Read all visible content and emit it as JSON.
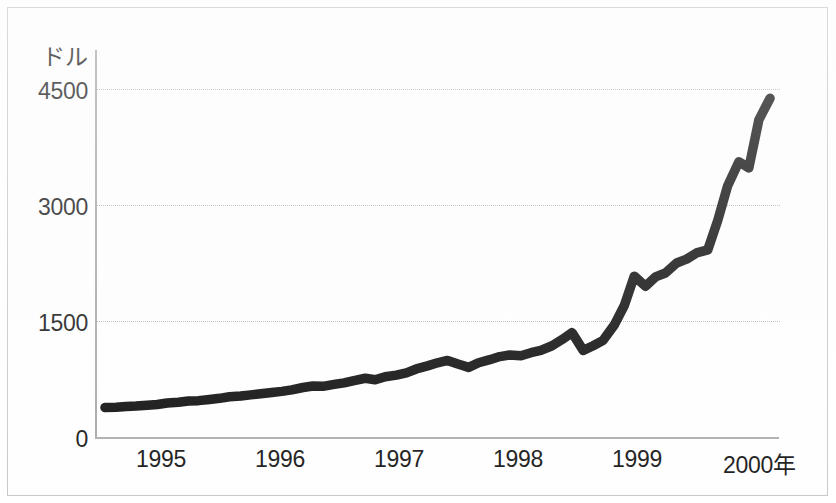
{
  "chart_data": {
    "type": "line",
    "title": "",
    "subtitle": "",
    "xlabel": "",
    "ylabel": "ドル",
    "x_axis_unit_label": "2000年",
    "ylim": [
      0,
      4800
    ],
    "xlim": [
      1994.5,
      2000.0
    ],
    "grid": "horizontal-dotted",
    "legend": "none",
    "line_color": "#141414",
    "grid_color": "#b9b9b9",
    "axis_color": "#aaaaaa",
    "y_ticks": [
      0,
      1500,
      3000,
      4500
    ],
    "y_tick_labels": [
      "0",
      "1500",
      "3000",
      "4500"
    ],
    "x_ticks": [
      1995,
      1996,
      1997,
      1998,
      1999,
      2000
    ],
    "x_tick_labels": [
      "1995",
      "1996",
      "1997",
      "1998",
      "1999",
      "2000年"
    ],
    "series": [
      {
        "name": "price",
        "x": [
          1994.58,
          1994.67,
          1994.75,
          1994.83,
          1994.92,
          1995.0,
          1995.08,
          1995.17,
          1995.25,
          1995.33,
          1995.42,
          1995.5,
          1995.58,
          1995.67,
          1995.75,
          1995.83,
          1995.92,
          1996.0,
          1996.08,
          1996.17,
          1996.25,
          1996.33,
          1996.42,
          1996.5,
          1996.58,
          1996.67,
          1996.75,
          1996.83,
          1996.92,
          1997.0,
          1997.08,
          1997.17,
          1997.25,
          1997.33,
          1997.42,
          1997.5,
          1997.58,
          1997.67,
          1997.75,
          1997.83,
          1997.92,
          1998.0,
          1998.08,
          1998.17,
          1998.25,
          1998.33,
          1998.42,
          1998.5,
          1998.58,
          1998.67,
          1998.75,
          1998.83,
          1998.92,
          1999.0,
          1999.08,
          1999.17,
          1999.25,
          1999.33,
          1999.42,
          1999.5,
          1999.58,
          1999.67,
          1999.75,
          1999.83,
          1999.92
        ],
        "values": [
          380,
          385,
          395,
          400,
          410,
          420,
          440,
          450,
          465,
          470,
          485,
          500,
          520,
          530,
          545,
          560,
          575,
          590,
          610,
          640,
          660,
          655,
          680,
          700,
          730,
          760,
          740,
          780,
          800,
          830,
          880,
          920,
          960,
          990,
          940,
          900,
          960,
          1000,
          1040,
          1060,
          1050,
          1090,
          1120,
          1180,
          1260,
          1350,
          1120,
          1180,
          1250,
          1450,
          1700,
          2080,
          1950,
          2070,
          2120,
          2250,
          2300,
          2380,
          2420,
          2800,
          3250,
          3560,
          3480,
          4100,
          4380
        ]
      }
    ],
    "peak_value": 4400,
    "final_value": 4150,
    "start_value": 380
  },
  "axis": {
    "y_title": "ドル",
    "y_tick_0": "0",
    "y_tick_1": "1500",
    "y_tick_2": "3000",
    "y_tick_3": "4500",
    "x_tick_0": "1995",
    "x_tick_1": "1996",
    "x_tick_2": "1997",
    "x_tick_3": "1998",
    "x_tick_4": "1999",
    "x_tick_5": "2000年"
  }
}
